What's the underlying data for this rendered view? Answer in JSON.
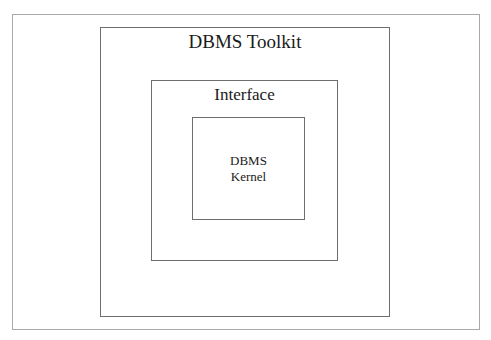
{
  "diagram": {
    "type": "nested-boxes",
    "layers": [
      {
        "id": "toolkit",
        "label": "DBMS Toolkit"
      },
      {
        "id": "interface",
        "label": "Interface"
      },
      {
        "id": "kernel",
        "label_lines": [
          "DBMS",
          "Kernel"
        ]
      }
    ],
    "colors": {
      "background": "#ffffff",
      "border": "#6e6e6e",
      "frame_border": "#a8a8a8",
      "text": "#1a1a1a"
    }
  }
}
